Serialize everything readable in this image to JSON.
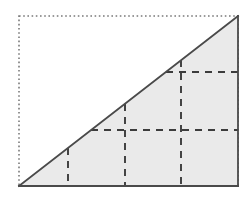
{
  "figure": {
    "name": "right-triangle-with-grid-partition",
    "canvas": {
      "width": 249,
      "height": 201,
      "background": "#ffffff"
    },
    "bounding_box": {
      "label": "dotted-bounding-rectangle",
      "x": 19,
      "y": 16,
      "width": 219,
      "height": 170,
      "stroke": "#7a7a7a",
      "stroke_width": 1.6,
      "dash_pattern": "1.6 2.6",
      "fill": "none"
    },
    "triangle": {
      "label": "shaded-right-triangle",
      "points": "19,186 238,186 238,16",
      "vertices": [
        {
          "name": "bottom-left-vertex",
          "x": 19,
          "y": 186
        },
        {
          "name": "bottom-right-vertex",
          "x": 238,
          "y": 186
        },
        {
          "name": "top-right-vertex",
          "x": 238,
          "y": 16
        }
      ],
      "fill": "#eaeaea",
      "stroke": "#4a4a4a",
      "stroke_width": 1.8
    },
    "base_edge": {
      "label": "base-edge",
      "x1": 19,
      "y1": 186,
      "x2": 238,
      "y2": 186
    },
    "vertical_edge": {
      "label": "right-vertical-edge",
      "x1": 238,
      "y1": 186,
      "x2": 238,
      "y2": 16
    },
    "hypotenuse": {
      "label": "hypotenuse-edge",
      "x1": 19,
      "y1": 186,
      "x2": 238,
      "y2": 16
    },
    "grid": {
      "stroke": "#3c3c3c",
      "stroke_width": 1.9,
      "dash_pattern": "7 6",
      "vertical_lines": [
        {
          "name": "vertical-grid-line-1",
          "x": 68,
          "y_top": 148,
          "y_bottom": 186
        },
        {
          "name": "vertical-grid-line-2",
          "x": 125,
          "y_top": 104,
          "y_bottom": 186
        },
        {
          "name": "vertical-grid-line-3",
          "x": 181,
          "y_top": 60,
          "y_bottom": 186
        }
      ],
      "horizontal_lines": [
        {
          "name": "horizontal-grid-line-1",
          "y": 130,
          "x_left": 91,
          "x_right": 238
        },
        {
          "name": "horizontal-grid-line-2",
          "y": 72,
          "x_left": 166,
          "x_right": 238
        }
      ]
    }
  }
}
